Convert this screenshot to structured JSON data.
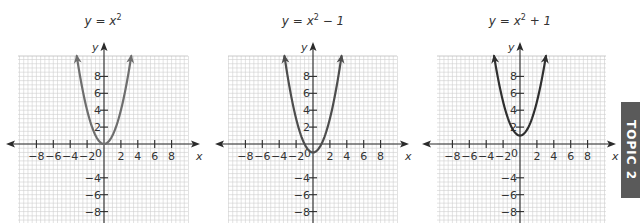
{
  "chart_data": [
    {
      "type": "line",
      "title": "y = x²",
      "title_parts": {
        "lhs": "y = x",
        "sup": "2",
        "rhs": ""
      },
      "function": "x^2",
      "vertex": [
        0,
        0
      ],
      "xlabel": "x",
      "ylabel": "y",
      "xlim": [
        -10,
        10
      ],
      "ylim": [
        -11,
        10
      ],
      "x_ticks": [
        -8,
        -6,
        -4,
        -2,
        2,
        4,
        6,
        8
      ],
      "x_tick_labels": [
        "−8",
        "−6",
        "−4",
        "−2",
        "2",
        "4",
        "6",
        "8"
      ],
      "y_ticks": [
        8,
        6,
        4,
        2,
        -4,
        -6,
        -8
      ],
      "y_tick_labels": [
        "8",
        "6",
        "4",
        "2",
        "−4",
        "−6",
        "−8"
      ],
      "origin_label": "0",
      "grid": true,
      "x": [
        -3.1,
        -3,
        -2,
        -1,
        0,
        1,
        2,
        3,
        3.1
      ],
      "y": [
        9.61,
        9,
        4,
        1,
        0,
        1,
        4,
        9,
        9.61
      ],
      "curve_color": "#6e6e6e"
    },
    {
      "type": "line",
      "title": "y = x² − 1",
      "title_parts": {
        "lhs": "y = x",
        "sup": "2",
        "rhs": " − 1"
      },
      "function": "x^2 - 1",
      "vertex": [
        0,
        -1
      ],
      "xlabel": "x",
      "ylabel": "y",
      "xlim": [
        -10,
        10
      ],
      "ylim": [
        -11,
        10
      ],
      "x_ticks": [
        -8,
        -6,
        -4,
        -2,
        2,
        4,
        6,
        8
      ],
      "x_tick_labels": [
        "−8",
        "−6",
        "−4",
        "−2",
        "2",
        "4",
        "6",
        "8"
      ],
      "y_ticks": [
        8,
        6,
        4,
        2,
        -4,
        -6,
        -8
      ],
      "y_tick_labels": [
        "8",
        "6",
        "4",
        "2",
        "−4",
        "−6",
        "−8"
      ],
      "origin_label": "0",
      "grid": true,
      "x": [
        -3.3,
        -3,
        -2,
        -1,
        0,
        1,
        2,
        3,
        3.3
      ],
      "y": [
        9.89,
        8,
        3,
        0,
        -1,
        0,
        3,
        8,
        9.89
      ],
      "curve_color": "#4d4d4d"
    },
    {
      "type": "line",
      "title": "y = x² + 1",
      "title_parts": {
        "lhs": "y = x",
        "sup": "2",
        "rhs": " + 1"
      },
      "function": "x^2 + 1",
      "vertex": [
        0,
        1
      ],
      "xlabel": "x",
      "ylabel": "y",
      "xlim": [
        -10,
        10
      ],
      "ylim": [
        -11,
        10
      ],
      "x_ticks": [
        -8,
        -6,
        -4,
        -2,
        2,
        4,
        6,
        8
      ],
      "x_tick_labels": [
        "−8",
        "−6",
        "−4",
        "−2",
        "2",
        "4",
        "6",
        "8"
      ],
      "y_ticks": [
        8,
        6,
        4,
        2,
        -4,
        -6,
        -8
      ],
      "y_tick_labels": [
        "8",
        "6",
        "4",
        "2",
        "−4",
        "−6",
        "−8"
      ],
      "origin_label": "0",
      "grid": true,
      "x": [
        -3,
        -2,
        -1,
        0,
        1,
        2,
        3
      ],
      "y": [
        10,
        5,
        2,
        1,
        2,
        5,
        10
      ],
      "curve_color": "#2f2f2f"
    }
  ],
  "side_tab": {
    "label": "TOPIC 2",
    "color": "#5a5a5a"
  },
  "layout": {
    "panels": [
      {
        "origin_x": 104,
        "origin_y": 144,
        "grid_left": 18,
        "grid_right": 188
      },
      {
        "origin_x": 313,
        "origin_y": 144,
        "grid_left": 228,
        "grid_right": 397
      },
      {
        "origin_x": 520,
        "origin_y": 144,
        "grid_left": 437,
        "grid_right": 606
      }
    ],
    "unit_px": 8.45,
    "grid_top": 56
  }
}
